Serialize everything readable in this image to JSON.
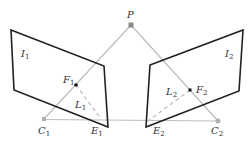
{
  "diagram": {
    "colors": {
      "plane_stroke": "#222222",
      "ray_stroke": "#b8b8b8",
      "point_gray": "#9a9a9a",
      "point_black": "#111111",
      "label": "#333333"
    },
    "points": {
      "P": {
        "label": "P",
        "sub": "",
        "x": 131,
        "y": 25
      },
      "C1": {
        "label": "C",
        "sub": "1",
        "x": 44,
        "y": 119
      },
      "C2": {
        "label": "C",
        "sub": "2",
        "x": 218,
        "y": 121
      },
      "E1": {
        "label": "E",
        "sub": "1",
        "x": 101,
        "y": 119
      },
      "E2": {
        "label": "E",
        "sub": "2",
        "x": 148,
        "y": 121
      },
      "F1": {
        "label": "F",
        "sub": "1",
        "x": 76,
        "y": 85
      },
      "F2": {
        "label": "F",
        "sub": "2",
        "x": 190,
        "y": 90
      }
    },
    "planes": {
      "I1": {
        "label": "I",
        "sub": "1"
      },
      "I2": {
        "label": "I",
        "sub": "2"
      }
    },
    "lines": {
      "L1": {
        "label": "L",
        "sub": "1"
      },
      "L2": {
        "label": "L",
        "sub": "2"
      }
    }
  }
}
